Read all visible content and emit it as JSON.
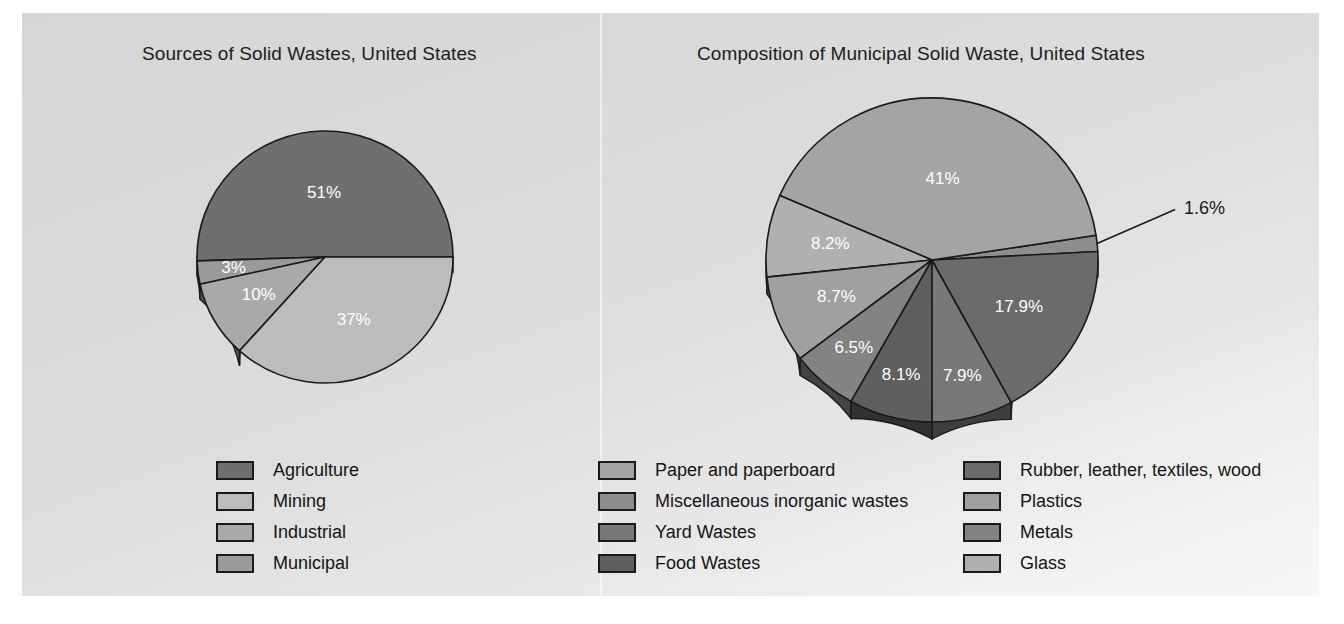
{
  "figure": {
    "background_color": "#ffffff",
    "panel_color": "#dedede"
  },
  "charts": [
    {
      "title": "Sources of Solid Wastes, United States",
      "legend": [
        {
          "label": "Agriculture",
          "color": "#6f6f6f"
        },
        {
          "label": "Mining",
          "color": "#bcbcbc"
        },
        {
          "label": "Industrial",
          "color": "#a9a9a9"
        },
        {
          "label": "Municipal",
          "color": "#9a9a9a"
        }
      ]
    },
    {
      "title": "Composition of Municipal Solid Waste, United States",
      "legend_column_1": [
        {
          "label": "Paper and paperboard",
          "color": "#a4a4a4"
        },
        {
          "label": "Miscellaneous inorganic wastes",
          "color": "#8d8d8d"
        },
        {
          "label": "Yard Wastes",
          "color": "#787878"
        },
        {
          "label": "Food Wastes",
          "color": "#5f5f5f"
        }
      ],
      "legend_column_2": [
        {
          "label": "Rubber, leather, textiles, wood",
          "color": "#6b6b6b"
        },
        {
          "label": "Plastics",
          "color": "#a0a0a0"
        },
        {
          "label": "Metals",
          "color": "#838383"
        },
        {
          "label": "Glass",
          "color": "#b0b0b0"
        }
      ]
    }
  ],
  "chart_data": [
    {
      "type": "pie",
      "title": "Sources of Solid Wastes, United States",
      "labels": [
        "Agriculture",
        "Mining",
        "Municipal",
        "Industrial"
      ],
      "values": [
        51,
        37,
        3,
        10
      ],
      "value_labels": [
        "51%",
        "37%",
        "3%",
        "10%"
      ],
      "colors": [
        "#6f6f6f",
        "#bcbcbc",
        "#9a9a9a",
        "#a9a9a9"
      ],
      "units": "percent",
      "legend_position": "bottom",
      "three_d": true,
      "slices": [
        {
          "label": "Agriculture",
          "value": 51,
          "display": "51%",
          "color": "#6f6f6f"
        },
        {
          "label": "Mining",
          "value": 37,
          "display": "37%",
          "color": "#bcbcbc"
        },
        {
          "label": "Municipal",
          "value": 3,
          "display": "3%",
          "color": "#9a9a9a"
        },
        {
          "label": "Industrial",
          "value": 10,
          "display": "10%",
          "color": "#a9a9a9"
        }
      ]
    },
    {
      "type": "pie",
      "title": "Composition of Municipal Solid Waste, United States",
      "labels": [
        "Paper and paperboard",
        "Rubber, leather, textiles, wood",
        "Yard Wastes",
        "Food Wastes",
        "Metals",
        "Plastics",
        "Miscellaneous inorganic wastes",
        "Glass"
      ],
      "values": [
        41,
        17.9,
        7.9,
        8.1,
        6.5,
        8.7,
        1.6,
        8.2
      ],
      "value_labels": [
        "41%",
        "17.9%",
        "7.9%",
        "8.1%",
        "6.5%",
        "8.7%",
        "1.6%",
        "8.2%"
      ],
      "colors": [
        "#a4a4a4",
        "#6b6b6b",
        "#787878",
        "#5f5f5f",
        "#838383",
        "#a0a0a0",
        "#8d8d8d",
        "#b0b0b0"
      ],
      "units": "percent",
      "legend_position": "bottom",
      "three_d": true,
      "outside_labels": [
        "1.6%"
      ],
      "slices": [
        {
          "label": "Paper and paperboard",
          "value": 41,
          "display": "41%",
          "color": "#a4a4a4"
        },
        {
          "label": "Miscellaneous inorganic wastes",
          "value": 1.6,
          "display": "1.6%",
          "color": "#8d8d8d"
        },
        {
          "label": "Rubber, leather, textiles, wood",
          "value": 17.9,
          "display": "17.9%",
          "color": "#6b6b6b"
        },
        {
          "label": "Yard Wastes",
          "value": 7.9,
          "display": "7.9%",
          "color": "#787878"
        },
        {
          "label": "Food Wastes",
          "value": 8.1,
          "display": "8.1%",
          "color": "#5f5f5f"
        },
        {
          "label": "Metals",
          "value": 6.5,
          "display": "6.5%",
          "color": "#838383"
        },
        {
          "label": "Plastics",
          "value": 8.7,
          "display": "8.7%",
          "color": "#a0a0a0"
        },
        {
          "label": "Glass",
          "value": 8.2,
          "display": "8.2%",
          "color": "#b0b0b0"
        }
      ]
    }
  ]
}
